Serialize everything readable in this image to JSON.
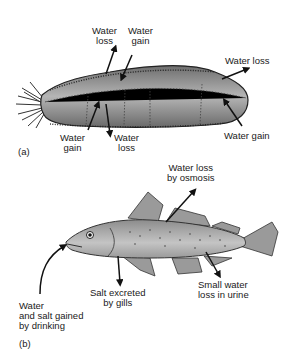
{
  "panel_a": {
    "label": "(a)",
    "organism": "sea-cucumber",
    "labels": {
      "top_left_1": "Water",
      "top_left_2": "loss",
      "top_mid_1": "Water",
      "top_mid_2": "gain",
      "right_top": "Water loss",
      "right_bottom": "Water gain",
      "bottom_left_1": "Water",
      "bottom_left_2": "gain",
      "bottom_mid_1": "Water",
      "bottom_mid_2": "loss"
    }
  },
  "panel_b": {
    "label": "(b)",
    "organism": "marine-fish",
    "labels": {
      "osmosis_1": "Water loss",
      "osmosis_2": "by osmosis",
      "drink_1": "Water",
      "drink_2": "and salt gained",
      "drink_3": "by drinking",
      "gills_1": "Salt excreted",
      "gills_2": "by gills",
      "urine_1": "Small water",
      "urine_2": "loss in urine"
    }
  },
  "colors": {
    "body_fill": "#8a8a8a",
    "body_light": "#c8c8c8",
    "outline": "#1a1a1a",
    "arrow": "#111111"
  }
}
